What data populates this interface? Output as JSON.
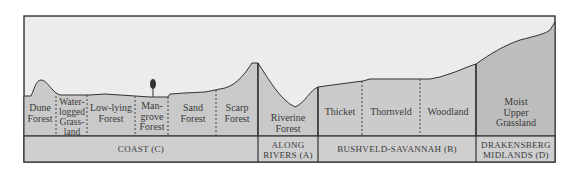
{
  "diagram": {
    "title": "",
    "colors": {
      "sky": "#ececec",
      "ground": "#c9c9c9",
      "band": "#cfcfcf",
      "dark_ground": "#bcbcbc",
      "line": "#333333"
    },
    "vegetation_zones": [
      {
        "id": "dune-forest",
        "label": "Dune\nForest",
        "region": "C"
      },
      {
        "id": "waterlogged-grassland",
        "label": "Water-\nlogged\nGrass-\nland",
        "region": "C"
      },
      {
        "id": "low-lying-forest",
        "label": "Low-lying\nForest",
        "region": "C"
      },
      {
        "id": "mangrove-forest",
        "label": "Man-\ngrove\nForest",
        "region": "C"
      },
      {
        "id": "sand-forest",
        "label": "Sand\nForest",
        "region": "C"
      },
      {
        "id": "scarp-forest",
        "label": "Scarp\nForest",
        "region": "C"
      },
      {
        "id": "riverine-forest",
        "label": "Riverine\nForest",
        "region": "A"
      },
      {
        "id": "thicket",
        "label": "Thicket",
        "region": "B"
      },
      {
        "id": "thornveld",
        "label": "Thornveld",
        "region": "B"
      },
      {
        "id": "woodland",
        "label": "Woodland",
        "region": "B"
      },
      {
        "id": "moist-upper-grassland",
        "label": "Moist\nUpper\nGrassland",
        "region": "D"
      }
    ],
    "regions": [
      {
        "id": "C",
        "label": "COAST (C)"
      },
      {
        "id": "A",
        "label": "ALONG\nRIVERS (A)"
      },
      {
        "id": "B",
        "label": "BUSHVELD-SAVANNAH  (B)"
      },
      {
        "id": "D",
        "label": "DRAKENSBERG\nMIDLANDS  (D)"
      }
    ],
    "icons": {
      "mangrove_tree": "tree-icon"
    }
  }
}
